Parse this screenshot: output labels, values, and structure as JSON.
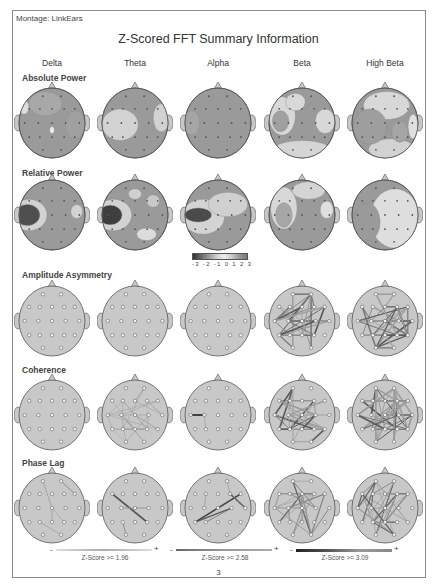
{
  "header": {
    "montage_label": "Montage:",
    "montage_value": "LinkEars",
    "title": "Z-Scored FFT Summary Information"
  },
  "columns": [
    "Delta",
    "Theta",
    "Alpha",
    "Beta",
    "High Beta"
  ],
  "rows": [
    {
      "label": "Absolute Power",
      "type": "topomap"
    },
    {
      "label": "Relative Power",
      "type": "topomap"
    },
    {
      "label": "Amplitude Asymmetry",
      "type": "connectivity"
    },
    {
      "label": "Coherence",
      "type": "connectivity"
    },
    {
      "label": "Phase Lag",
      "type": "connectivity"
    }
  ],
  "color_scale": {
    "ticks": [
      "-3",
      "-2",
      "-1",
      "0",
      "1",
      "2",
      "3"
    ]
  },
  "z_score_legends": [
    {
      "minus": "-",
      "plus": "+",
      "label": "Z-Score >= 1.96",
      "color": "#aaaaaa"
    },
    {
      "minus": "-",
      "plus": "+",
      "label": "Z-Score >= 2.58",
      "color": "#777777"
    },
    {
      "minus": "-",
      "plus": "+",
      "label": "Z-Score >= 3.09",
      "color": "#333333"
    }
  ],
  "page_number": "3",
  "colors": {
    "head_fill": "#c8c8c8",
    "head_base": "#9a9a9a",
    "light_region": "#d4d4d4",
    "dark_region": "#555555",
    "line_light": "#a0a0a0",
    "line_dark": "#5a5a5a"
  }
}
